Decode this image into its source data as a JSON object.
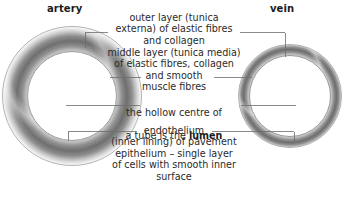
{
  "diagram": {
    "title_left": "artery",
    "title_right": "vein",
    "labels": {
      "outer_layer": "outer layer (tunica\nexterna) of elastic fibres\nand collagen",
      "middle_layer": "middle layer (tunica media)\nof elastic fibres, collagen\nand smooth\nmuscle fibres",
      "lumen_line1": "the hollow centre of",
      "lumen_line2_pre": "a tube is the ",
      "lumen_keyword": "lumen",
      "endothelium": "endothelium\n(inner lining) of pavement\nepithelium – single layer\nof cells with smooth inner\nsurface"
    },
    "colors": {
      "background": "#ffffff",
      "text": "#2a2a2a",
      "heading": "#1b1b1b",
      "leader_line": "#6b6b6b",
      "wall_dark": "#6f6f6f",
      "wall_mid": "#8e8e8e",
      "wall_light": "#c9c9c9"
    }
  }
}
